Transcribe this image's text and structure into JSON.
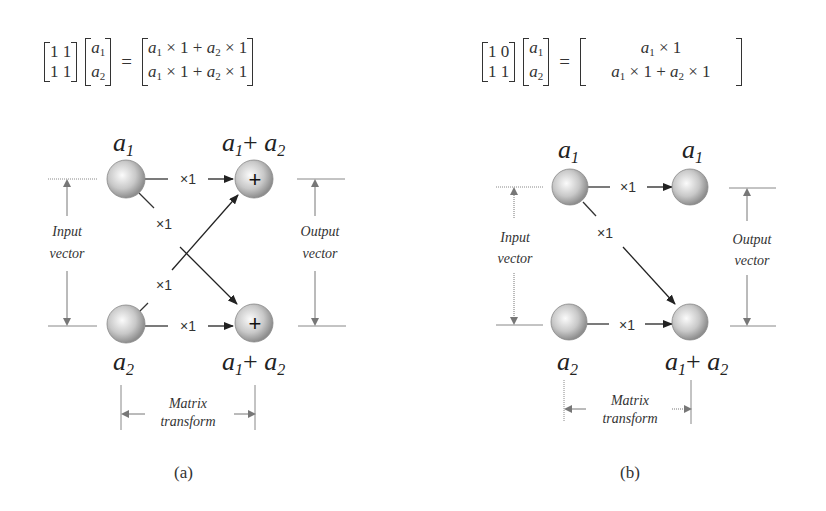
{
  "panels": [
    {
      "id": "a",
      "caption": "(a)",
      "equation": {
        "matrix": [
          [
            "1",
            "1"
          ],
          [
            "1",
            "1"
          ]
        ],
        "vector": [
          "a",
          "a"
        ],
        "vector_subs": [
          "1",
          "2"
        ],
        "result": [
          "a1 × 1 + a2 × 1",
          "a1 × 1 + a2 × 1"
        ]
      },
      "nodes": {
        "input_top": "a1",
        "input_bottom": "a2",
        "output_top": "a1+ a2",
        "output_bottom": "a1+ a2",
        "output_symbol": "+"
      },
      "edge_weights": [
        "×1",
        "×1",
        "×1",
        "×1"
      ],
      "labels": {
        "input": [
          "Input",
          "vector"
        ],
        "output": [
          "Output",
          "vector"
        ],
        "transform": [
          "Matrix",
          "transform"
        ]
      }
    },
    {
      "id": "b",
      "caption": "(b)",
      "equation": {
        "matrix": [
          [
            "1",
            "0"
          ],
          [
            "1",
            "1"
          ]
        ],
        "vector": [
          "a",
          "a"
        ],
        "vector_subs": [
          "1",
          "2"
        ],
        "result": [
          "a1 × 1",
          "a1 × 1 + a2 × 1"
        ]
      },
      "nodes": {
        "input_top": "a1",
        "input_bottom": "a2",
        "output_top": "a1",
        "output_bottom": "a1+ a2"
      },
      "edge_weights": [
        "×1",
        "×1",
        "×1"
      ],
      "labels": {
        "input": [
          "Input",
          "vector"
        ],
        "output": [
          "Output",
          "vector"
        ],
        "transform": [
          "Matrix",
          "transform"
        ]
      }
    }
  ],
  "colors": {
    "node_fill_center": "#f4f4f4",
    "node_fill_edge": "#9a9a9a",
    "line": "#333333",
    "guide": "#777777"
  }
}
